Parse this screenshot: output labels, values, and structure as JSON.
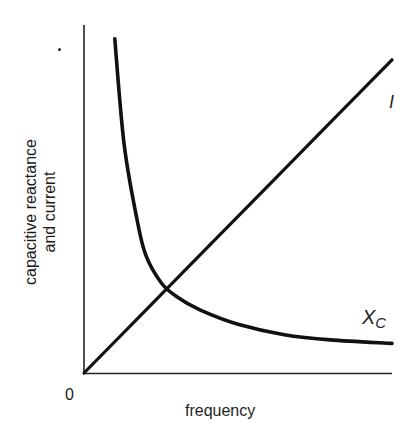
{
  "chart_data": {
    "type": "line",
    "title": "",
    "xlabel": "frequency",
    "ylabel": "capacitive reactance and current",
    "ylabel_lines": [
      "capacitive reactance",
      "and current"
    ],
    "origin_label": "0",
    "grid": false,
    "legend": "none (curves labelled directly)",
    "x_range": [
      0,
      1
    ],
    "y_range": [
      0,
      1
    ],
    "series": [
      {
        "name": "I",
        "label": "I",
        "description": "current, proportional to frequency (straight line through origin)",
        "x": [
          0.0,
          0.2,
          0.4,
          0.6,
          0.8,
          1.0
        ],
        "values": [
          0.0,
          0.18,
          0.36,
          0.54,
          0.72,
          0.9
        ]
      },
      {
        "name": "Xc",
        "label": "X",
        "label_sub": "C",
        "description": "capacitive reactance, inversely proportional to frequency",
        "x": [
          0.1,
          0.13,
          0.17,
          0.2,
          0.25,
          0.3,
          0.38,
          0.5,
          0.65,
          0.8,
          1.0
        ],
        "values": [
          0.96,
          0.66,
          0.45,
          0.34,
          0.26,
          0.22,
          0.18,
          0.14,
          0.11,
          0.095,
          0.085
        ]
      }
    ],
    "annotations": [
      {
        "text": "intersection of I and Xc",
        "x": 0.3,
        "y": 0.26
      }
    ],
    "colors": {
      "line": "#111111",
      "axis": "#222222",
      "background": "#ffffff"
    }
  }
}
